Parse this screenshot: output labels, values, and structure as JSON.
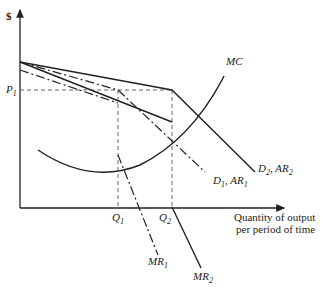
{
  "diagram": {
    "type": "kinked-demand-curve",
    "y_axis_label": "$",
    "x_axis_label_line1": "Quantity of output",
    "x_axis_label_line2": "per period of time",
    "price_label": "P",
    "price_sub": "1",
    "q1_label": "Q",
    "q1_sub": "1",
    "q2_label": "Q",
    "q2_sub": "2",
    "mc_label": "MC",
    "d1_label_a": "D",
    "d1_sub_a": "1",
    "d1_label_b": ", AR",
    "d1_sub_b": "1",
    "d2_label_a": "D",
    "d2_sub_a": "2",
    "d2_label_b": ", AR",
    "d2_sub_b": "2",
    "mr1_label": "MR",
    "mr1_sub": "1",
    "mr2_label": "MR",
    "mr2_sub": "2",
    "line_color": "#222222"
  }
}
